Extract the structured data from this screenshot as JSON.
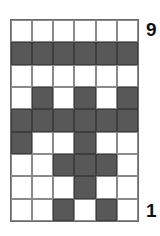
{
  "labels": {
    "top": "9",
    "bottom": "1"
  },
  "colors": {
    "filled": "#585858",
    "empty": "#ffffff",
    "border": "#8a8a8a"
  },
  "grid": {
    "columns": 6,
    "rows": 9,
    "cells": [
      [
        0,
        0,
        0,
        0,
        0,
        0
      ],
      [
        1,
        1,
        1,
        1,
        1,
        1
      ],
      [
        0,
        0,
        0,
        0,
        0,
        0
      ],
      [
        0,
        1,
        0,
        1,
        0,
        1
      ],
      [
        1,
        1,
        1,
        1,
        1,
        1
      ],
      [
        1,
        0,
        0,
        1,
        0,
        0
      ],
      [
        0,
        0,
        1,
        1,
        1,
        0
      ],
      [
        0,
        0,
        0,
        1,
        0,
        0
      ],
      [
        0,
        0,
        1,
        0,
        1,
        0
      ]
    ]
  }
}
